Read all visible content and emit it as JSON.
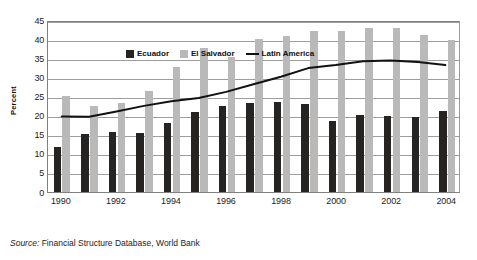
{
  "chart_data": {
    "type": "bar",
    "title": "",
    "subtitle": "",
    "xlabel": "",
    "ylabel": "Percent",
    "ylim": [
      0,
      45
    ],
    "ytick_step": 5,
    "yticks": [
      45,
      40,
      35,
      30,
      25,
      20,
      15,
      10,
      5,
      0
    ],
    "grid": true,
    "legend_position": "top-left-inside",
    "categories": [
      "1990",
      "1991",
      "1992",
      "1993",
      "1994",
      "1995",
      "1996",
      "1997",
      "1998",
      "1999",
      "2000",
      "2001",
      "2002",
      "2003",
      "2004"
    ],
    "xtick_labels": [
      "1990",
      "1992",
      "1994",
      "1996",
      "1998",
      "2000",
      "2002",
      "2004"
    ],
    "series": [
      {
        "name": "Ecuador",
        "kind": "bar",
        "color": "#262422",
        "values": [
          11.9,
          15.1,
          15.8,
          15.4,
          18.0,
          20.9,
          22.5,
          23.3,
          23.5,
          23.1,
          18.6,
          20.2,
          19.8,
          19.5,
          21.1
        ]
      },
      {
        "name": "El Salvador",
        "kind": "bar",
        "color": "#b9b9b9",
        "values": [
          25.0,
          22.6,
          23.4,
          26.4,
          32.6,
          37.7,
          35.2,
          40.0,
          40.7,
          42.0,
          42.2,
          42.8,
          42.8,
          41.0,
          39.7
        ]
      },
      {
        "name": "Latin America",
        "kind": "line",
        "color": "#111111",
        "values": [
          20.0,
          19.9,
          21.3,
          22.8,
          24.0,
          24.9,
          26.5,
          28.5,
          30.5,
          32.8,
          33.6,
          34.6,
          34.8,
          34.4,
          33.6
        ]
      }
    ]
  },
  "legend": {
    "items": [
      {
        "label": "Ecuador",
        "marker": "dark-square-swatch"
      },
      {
        "label": "El Salvador",
        "marker": "light-square-swatch"
      },
      {
        "label": "Latin America",
        "marker": "line-swatch"
      }
    ]
  },
  "axis": {
    "y_title": "Percent"
  },
  "source": {
    "prefix": "Source:",
    "text": "Financial Structure Database, World Bank"
  }
}
